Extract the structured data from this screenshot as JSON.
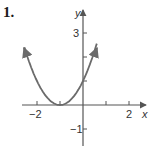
{
  "problem_number": "1.",
  "chart_data": {
    "type": "line",
    "title": "",
    "function": "y = (x + 1)^2",
    "xlabel": "x",
    "ylabel": "y",
    "x_ticks": [
      -2,
      -1,
      1,
      2
    ],
    "x_tick_labels": [
      "-2",
      "2"
    ],
    "y_ticks": [
      -1,
      1,
      2,
      3
    ],
    "y_tick_labels": [
      "-1",
      "3"
    ],
    "xlim": [
      -2.6,
      2.7
    ],
    "ylim": [
      -1.7,
      4.2
    ],
    "grid": false,
    "series": [
      {
        "name": "parabola",
        "x": [
          -2.5,
          -2,
          -1.5,
          -1,
          -0.5,
          0,
          0.5
        ],
        "y": [
          2.25,
          1,
          0.25,
          0,
          0.25,
          1,
          2.25
        ],
        "color": "#6b6b6b"
      }
    ],
    "vertex": [
      -1,
      0
    ],
    "y_intercept": 1
  },
  "labels": {
    "x_axis": "x",
    "y_axis": "y",
    "x_neg2": "−2",
    "x_2": "2",
    "y_3": "3",
    "y_neg1": "−1"
  }
}
